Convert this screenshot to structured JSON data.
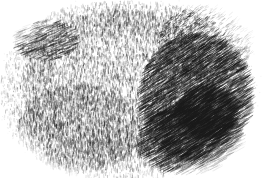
{
  "image": {
    "kind": "stipple-engraving-illustration",
    "title": "Stipple engraving of a rounded organic mass",
    "subject": "rounded lumpy object resembling a stone, sponge or loaf",
    "medium": "pen-and-ink stipple and hatch engraving",
    "palette": "monochrome grayscale",
    "width": 271,
    "height": 178,
    "background_color": "#ffffff",
    "ink_color": "#1a1a1a",
    "has_text": false,
    "has_border": false
  },
  "silhouette": {
    "shape": "rounded blob, wider than tall, flat-ish top, domed right flank",
    "bounds": {
      "left": 14,
      "top": 7,
      "right": 243,
      "bottom": 171
    },
    "center": {
      "x": 128,
      "y": 88
    },
    "radius_x": 114,
    "radius_y": 82,
    "edge_softness": 16
  },
  "regions": [
    {
      "name": "core-stipple-field",
      "description": "dense random vertical stipple strokes forming the body mass",
      "center": {
        "x": 118,
        "y": 84
      },
      "radius_x": 96,
      "radius_y": 74,
      "texture": "stipple",
      "density": 0.52,
      "darkness": 0.42,
      "stroke_angle_deg": 90,
      "stroke_len": 2.6
    },
    {
      "name": "right-flank-hatching",
      "description": "diagonal engraved hatch lines shading the right side",
      "center": {
        "x": 196,
        "y": 98
      },
      "radius_x": 56,
      "radius_y": 64,
      "texture": "hatch",
      "density": 0.72,
      "darkness": 0.66,
      "stroke_angle_deg": 32,
      "stroke_len": 7.5
    },
    {
      "name": "top-right-dither",
      "description": "halftone dithered gradient across the upper right shoulder",
      "center": {
        "x": 205,
        "y": 44
      },
      "radius_x": 48,
      "radius_y": 38,
      "texture": "dither",
      "density": 0.6,
      "darkness": 0.5,
      "stroke_angle_deg": 35,
      "stroke_len": 4.5
    },
    {
      "name": "bottom-right-contour-hatch",
      "description": "curving hatch lines following the lower right contour",
      "center": {
        "x": 190,
        "y": 140
      },
      "radius_x": 52,
      "radius_y": 34,
      "texture": "hatch",
      "density": 0.62,
      "darkness": 0.6,
      "stroke_angle_deg": 28,
      "stroke_len": 8.5
    },
    {
      "name": "upper-left-shadow-band",
      "description": "darker diagonal fold shadow in the upper left lobe",
      "center": {
        "x": 46,
        "y": 40
      },
      "radius_x": 32,
      "radius_y": 20,
      "texture": "hatch",
      "density": 0.5,
      "darkness": 0.52,
      "stroke_angle_deg": 22,
      "stroke_len": 5.5
    },
    {
      "name": "lower-left-stipple",
      "description": "vertical stroke stipple across the lower left quadrant",
      "center": {
        "x": 80,
        "y": 128
      },
      "radius_x": 62,
      "radius_y": 44,
      "texture": "stipple",
      "density": 0.5,
      "darkness": 0.44,
      "stroke_angle_deg": 88,
      "stroke_len": 3.2
    },
    {
      "name": "left-edge-falloff",
      "description": "sparse stipple fading to white at the left margin",
      "center": {
        "x": 30,
        "y": 92
      },
      "radius_x": 30,
      "radius_y": 56,
      "texture": "stipple",
      "density": 0.3,
      "darkness": 0.34,
      "stroke_angle_deg": 85,
      "stroke_len": 2.4
    },
    {
      "name": "bottom-edge-falloff",
      "description": "vertical strokes thinning out along the bottom margin",
      "center": {
        "x": 120,
        "y": 158
      },
      "radius_x": 76,
      "radius_y": 22,
      "texture": "stipple",
      "density": 0.32,
      "darkness": 0.38,
      "stroke_angle_deg": 90,
      "stroke_len": 3.0
    },
    {
      "name": "top-edge-falloff",
      "description": "stipple thinning out along the flat upper margin",
      "center": {
        "x": 126,
        "y": 20
      },
      "radius_x": 82,
      "radius_y": 18,
      "texture": "stipple",
      "density": 0.34,
      "darkness": 0.36,
      "stroke_angle_deg": 88,
      "stroke_len": 2.6
    },
    {
      "name": "deep-shadow-pocket",
      "description": "darkest concentrated hatch pocket on the right flank",
      "center": {
        "x": 207,
        "y": 112
      },
      "radius_x": 30,
      "radius_y": 26,
      "texture": "hatch",
      "density": 0.8,
      "darkness": 0.74,
      "stroke_angle_deg": 33,
      "stroke_len": 9.0
    }
  ],
  "corners": {
    "top_left": "#ffffff",
    "top_right": "#ffffff",
    "bottom_left": "#ffffff",
    "bottom_right": "#ffffff"
  }
}
